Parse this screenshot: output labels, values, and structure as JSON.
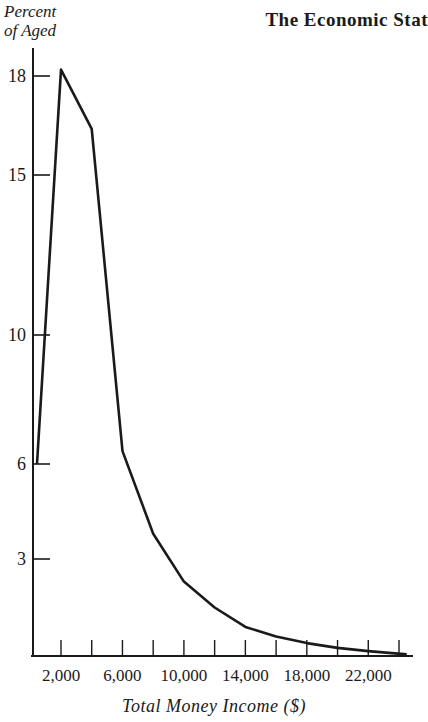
{
  "chart_data": {
    "type": "line",
    "title": "The Economic Stat",
    "ylabel": "Percent of Aged",
    "ylabel_lines": [
      "Percent",
      "of Aged"
    ],
    "xlabel": "Total Money Income ($)",
    "y_ticks": [
      18,
      15,
      10,
      6,
      3
    ],
    "x_tick_labels": [
      "2,000",
      "6,000",
      "10,000",
      "14,000",
      "18,000",
      "22,000"
    ],
    "x_tick_values": [
      2000,
      4000,
      6000,
      8000,
      10000,
      12000,
      14000,
      16000,
      18000,
      20000,
      22000,
      24000
    ],
    "grid": false,
    "legend": null,
    "series": [
      {
        "name": "Percent of Aged",
        "x": [
          1000,
          2000,
          4000,
          6000,
          8000,
          10000,
          12000,
          14000,
          16000,
          18000,
          20000,
          22000,
          24500
        ],
        "y": [
          6.0,
          18.2,
          16.4,
          6.4,
          3.8,
          2.3,
          1.5,
          0.9,
          0.6,
          0.4,
          0.25,
          0.15,
          0.05
        ]
      }
    ],
    "ylim": [
      0,
      19
    ],
    "xlim": [
      0,
      25000
    ]
  },
  "header": {
    "ylabel_line1": "Percent",
    "ylabel_line2": "of Aged",
    "title": "The Economic Stat"
  },
  "axis": {
    "xlabel": "Total Money Income ($)"
  }
}
